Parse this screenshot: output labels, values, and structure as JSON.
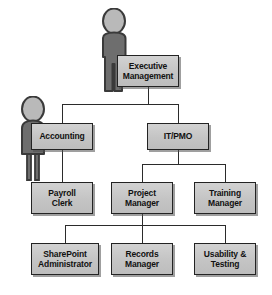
{
  "diagram": {
    "type": "org-chart",
    "background_color": "#ffffff",
    "node_fill_color": "#c8c8c8",
    "node_border_color": "#232323",
    "connector_color": "#2b2b2b",
    "figure_color": "#6e6e6e",
    "figure_head_color": "#bdbdbd"
  },
  "nodes": {
    "executive_management": {
      "label": "Executive\nManagement",
      "level": 1
    },
    "accounting": {
      "label": "Accounting",
      "level": 2
    },
    "it_pmo": {
      "label": "IT/PMO",
      "level": 2
    },
    "payroll_clerk": {
      "label": "Payroll\nClerk",
      "level": 3
    },
    "project_manager": {
      "label": "Project\nManager",
      "level": 3
    },
    "training_manager": {
      "label": "Training\nManager",
      "level": 3
    },
    "sharepoint_administrator": {
      "label": "SharePoint\nAdministrator",
      "level": 4
    },
    "records_manager": {
      "label": "Records\nManager",
      "level": 4
    },
    "usability_testing": {
      "label": "Usability &\nTesting",
      "level": 4
    }
  },
  "edges": [
    {
      "from": "executive_management",
      "to": "accounting"
    },
    {
      "from": "executive_management",
      "to": "it_pmo"
    },
    {
      "from": "accounting",
      "to": "payroll_clerk"
    },
    {
      "from": "it_pmo",
      "to": "project_manager"
    },
    {
      "from": "it_pmo",
      "to": "training_manager"
    },
    {
      "from": "project_manager",
      "to": "sharepoint_administrator"
    },
    {
      "from": "project_manager",
      "to": "records_manager"
    },
    {
      "from": "project_manager",
      "to": "usability_testing"
    }
  ],
  "figures": [
    {
      "name": "executive-person-figure",
      "pose": "standing-male",
      "attached_to": "executive_management"
    },
    {
      "name": "accounting-person-figure",
      "pose": "standing-female",
      "attached_to": "accounting"
    }
  ]
}
